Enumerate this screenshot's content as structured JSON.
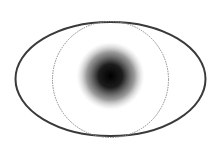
{
  "diagram": {
    "parts": [
      {
        "name": "eye-outline",
        "shape": "ellipse",
        "stroke": "#3a3a3a"
      },
      {
        "name": "iris-circle",
        "shape": "circle",
        "stroke": "#8a8a8a",
        "style": "dotted"
      },
      {
        "name": "pupil",
        "shape": "radial-gradient",
        "color": "#000000"
      }
    ],
    "colors": {
      "background": "#ffffff",
      "outline": "#3a3a3a",
      "iris": "#8a8a8a",
      "pupil": "#000000"
    }
  }
}
